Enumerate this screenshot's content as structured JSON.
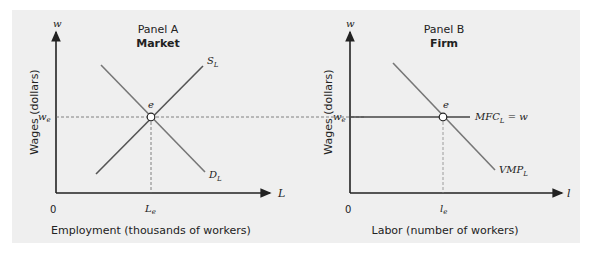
{
  "panels": [
    {
      "id": "A",
      "title": "Panel A",
      "subtitle": "Market",
      "y_axis": {
        "symbol": "w",
        "label": "Wages (dollars)",
        "tick": "w",
        "tick_sub": "e"
      },
      "x_axis": {
        "symbol": "L",
        "label": "Employment (thousands of workers)",
        "origin": "0",
        "tick": "L",
        "tick_sub": "e"
      },
      "curves": [
        {
          "name": "S",
          "sub": "L"
        },
        {
          "name": "D",
          "sub": "L"
        }
      ],
      "equilibrium_label": "e"
    },
    {
      "id": "B",
      "title": "Panel B",
      "subtitle": "Firm",
      "y_axis": {
        "symbol": "w",
        "label": "Wages (dollars)",
        "tick": "w",
        "tick_sub": "e"
      },
      "x_axis": {
        "symbol": "l",
        "label": "Labor (number of workers)",
        "origin": "0",
        "tick": "l",
        "tick_sub": "e"
      },
      "curves": [
        {
          "name": "MFC",
          "sub": "L",
          "suffix": " = w"
        },
        {
          "name": "VMP",
          "sub": "L"
        }
      ],
      "equilibrium_label": "e"
    }
  ],
  "colors": {
    "background": "#efefef",
    "axis": "#222222",
    "curve": "#666666",
    "dashed": "#666666"
  }
}
